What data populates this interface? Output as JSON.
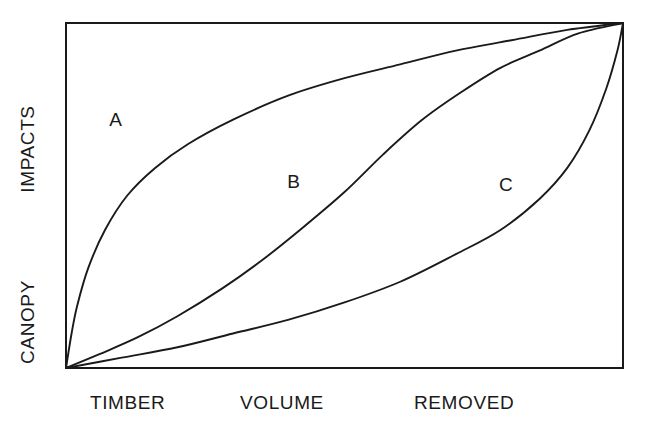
{
  "chart_data": {
    "type": "line",
    "title": "",
    "subtitle": "",
    "xlabel": "TIMBER VOLUME REMOVED",
    "ylabel": "CANOPY IMPACTS",
    "xlabel_words": [
      "TIMBER",
      "VOLUME",
      "REMOVED"
    ],
    "ylabel_words": [
      "IMPACTS",
      "CANOPY"
    ],
    "xlim": [
      0,
      1
    ],
    "ylim": [
      0,
      1
    ],
    "xtick_labels": [],
    "ytick_labels": [],
    "grid": false,
    "legend": "none",
    "axis_note": "Unlabelled schematic axes; both axes run 0 to 1 (relative). All three curves start at the origin and converge at the top-right maximum.",
    "annotations": [
      {
        "text": "A",
        "x": 0.09,
        "y": 0.72
      },
      {
        "text": "B",
        "x": 0.41,
        "y": 0.54
      },
      {
        "text": "C",
        "x": 0.79,
        "y": 0.53
      }
    ],
    "series": [
      {
        "name": "A",
        "shape": "concave-logarithmic",
        "description": "Impacts rise very steeply at low removal volume then saturate early.",
        "x": [
          0.0,
          0.01,
          0.02,
          0.04,
          0.07,
          0.11,
          0.16,
          0.22,
          0.3,
          0.4,
          0.5,
          0.6,
          0.7,
          0.8,
          0.9,
          1.0
        ],
        "y": [
          0.0,
          0.1,
          0.18,
          0.29,
          0.4,
          0.5,
          0.58,
          0.65,
          0.72,
          0.79,
          0.84,
          0.88,
          0.92,
          0.95,
          0.98,
          1.0
        ]
      },
      {
        "name": "B",
        "shape": "sigmoid",
        "description": "Impacts accumulate slowly at first, accelerate through the middle, then level off.",
        "x": [
          0.0,
          0.06,
          0.13,
          0.2,
          0.28,
          0.35,
          0.42,
          0.5,
          0.57,
          0.64,
          0.71,
          0.78,
          0.85,
          0.92,
          1.0
        ],
        "y": [
          0.0,
          0.04,
          0.09,
          0.15,
          0.23,
          0.31,
          0.4,
          0.51,
          0.62,
          0.72,
          0.8,
          0.87,
          0.92,
          0.97,
          1.0
        ]
      },
      {
        "name": "C",
        "shape": "convex-exponential",
        "description": "Impacts stay low across most of the removal range then rise abruptly at the end.",
        "x": [
          0.0,
          0.1,
          0.2,
          0.3,
          0.4,
          0.5,
          0.6,
          0.7,
          0.78,
          0.85,
          0.9,
          0.94,
          0.97,
          0.99,
          1.0
        ],
        "y": [
          0.0,
          0.03,
          0.06,
          0.1,
          0.14,
          0.19,
          0.25,
          0.33,
          0.4,
          0.49,
          0.58,
          0.69,
          0.81,
          0.92,
          1.0
        ]
      }
    ],
    "colors": {
      "curve": "#1a1a1a",
      "frame": "#1a1a1a",
      "background": "#ffffff"
    }
  }
}
